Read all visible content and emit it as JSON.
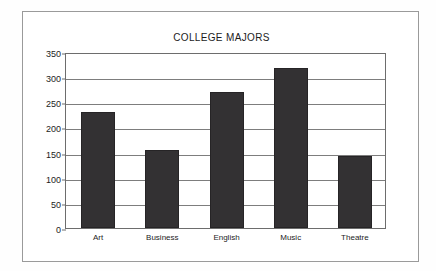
{
  "chart_data": {
    "type": "bar",
    "title": "COLLEGE MAJORS",
    "xlabel": "",
    "ylabel": "",
    "categories": [
      "Art",
      "Business",
      "English",
      "Music",
      "Theatre"
    ],
    "values": [
      230,
      156,
      270,
      318,
      144
    ],
    "ylim": [
      0,
      350
    ],
    "yticks": [
      0,
      50,
      100,
      150,
      200,
      250,
      300,
      350
    ],
    "ytick_labels": [
      "0",
      "50",
      "100",
      "150",
      "200",
      "250",
      "300",
      "350"
    ],
    "grid": true,
    "legend": false,
    "legend_position": "none",
    "bar_color": "#333133",
    "grid_color": "#7d7d7d",
    "axis_color": "#6d6d6d",
    "text_color": "#1c1c1c",
    "background": "#ffffff"
  }
}
